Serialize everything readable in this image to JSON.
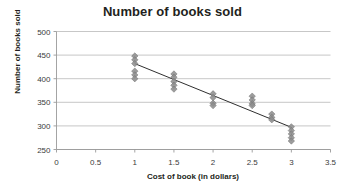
{
  "chart_data": {
    "type": "scatter",
    "title": "Number of books sold",
    "xlabel": "Cost of book (in dollars)",
    "ylabel": "Number of books sold",
    "xlim": [
      0,
      3.5
    ],
    "ylim": [
      250,
      500
    ],
    "xticks": [
      0,
      0.5,
      1,
      1.5,
      2,
      2.5,
      3,
      3.5
    ],
    "xtick_labels": [
      "0",
      "0.5",
      "1",
      "1.5",
      "2",
      "2.5",
      "3",
      "3.5"
    ],
    "yticks": [
      250,
      300,
      350,
      400,
      450,
      500
    ],
    "ytick_labels": [
      "250",
      "300",
      "350",
      "400",
      "450",
      "500"
    ],
    "grid": "horizontal",
    "legend": "none",
    "marker": "diamond",
    "marker_color": "#8e8e8e",
    "trendline_color": "#2f2f2f",
    "gridline_color": "#b9b9b9",
    "axis_color": "#9a9a9a",
    "background": "#ffffff",
    "points": [
      {
        "x": 1,
        "y": 448
      },
      {
        "x": 1,
        "y": 440
      },
      {
        "x": 1,
        "y": 432
      },
      {
        "x": 1,
        "y": 416
      },
      {
        "x": 1,
        "y": 408
      },
      {
        "x": 1,
        "y": 400
      },
      {
        "x": 1.5,
        "y": 410
      },
      {
        "x": 1.5,
        "y": 403
      },
      {
        "x": 1.5,
        "y": 394
      },
      {
        "x": 1.5,
        "y": 386
      },
      {
        "x": 1.5,
        "y": 378
      },
      {
        "x": 2,
        "y": 368
      },
      {
        "x": 2,
        "y": 360
      },
      {
        "x": 2,
        "y": 348
      },
      {
        "x": 2,
        "y": 343
      },
      {
        "x": 2.5,
        "y": 363
      },
      {
        "x": 2.5,
        "y": 355
      },
      {
        "x": 2.5,
        "y": 347
      },
      {
        "x": 2.5,
        "y": 343
      },
      {
        "x": 2.75,
        "y": 325
      },
      {
        "x": 2.75,
        "y": 318
      },
      {
        "x": 2.75,
        "y": 313
      },
      {
        "x": 3,
        "y": 298
      },
      {
        "x": 3,
        "y": 290
      },
      {
        "x": 3,
        "y": 283
      },
      {
        "x": 3,
        "y": 275
      },
      {
        "x": 3,
        "y": 268
      }
    ],
    "trendline": {
      "x1": 1,
      "y1": 432,
      "x2": 3,
      "y2": 297
    }
  }
}
